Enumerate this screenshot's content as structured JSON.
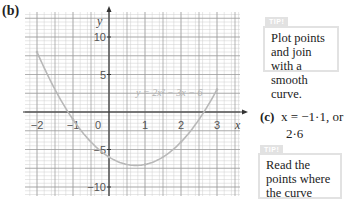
{
  "part_b": {
    "label": "(b)"
  },
  "part_c": {
    "label": "(c)",
    "answer_line1": "x = −1·1, or",
    "answer_line2": "2·6"
  },
  "tips": [
    {
      "tag": "TIP!",
      "text": "Plot points and join with a smooth curve."
    },
    {
      "tag": "TIP!",
      "text": "Read the points where the curve crosses the x-axis."
    }
  ],
  "chart_data": {
    "type": "line",
    "title": "",
    "equation_label": "y = 2x² − 3x − 6",
    "xlabel": "x",
    "ylabel": "y",
    "xlim": [
      -2,
      3
    ],
    "ylim": [
      -10,
      11
    ],
    "x_ticks": [
      -2,
      -1,
      0,
      1,
      2,
      3
    ],
    "y_ticks": [
      10,
      5,
      -5,
      -10
    ],
    "grid": true,
    "series": [
      {
        "name": "y = 2x² − 3x − 6",
        "x": [
          -2,
          -1.5,
          -1,
          -0.5,
          0,
          0.5,
          1,
          1.5,
          2,
          2.5,
          3
        ],
        "values": [
          8,
          3,
          -1,
          -4,
          -6,
          -7,
          -7,
          -6,
          -4,
          -1,
          3
        ]
      }
    ],
    "roots": [
      -1.1,
      2.6
    ],
    "colors": {
      "curve": "#b8b8b8",
      "grid_major": "#9a9a9a",
      "grid_minor": "#cfcfcf",
      "axis": "#333333"
    }
  }
}
